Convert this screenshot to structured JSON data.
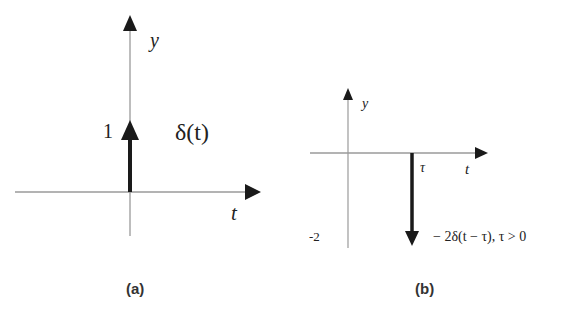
{
  "figures": [
    {
      "caption": "(a)",
      "y_axis_label": "y",
      "x_axis_label": "t",
      "impulse_value_label": "1",
      "impulse_label": "δ(t)",
      "impulse_direction": "up"
    },
    {
      "caption": "(b)",
      "y_axis_label": "y",
      "x_axis_label": "t",
      "shift_label": "τ",
      "impulse_value_label": "-2",
      "impulse_label": "− 2δ(t − τ), τ > 0",
      "impulse_direction": "down"
    }
  ],
  "colors": {
    "axis": "#9a9a9a",
    "impulse": "#1a1a1a",
    "text": "#222222"
  }
}
